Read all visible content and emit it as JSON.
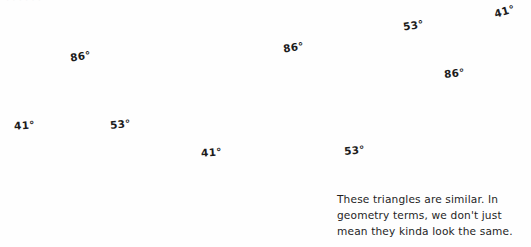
{
  "page": {
    "background_color": "#fefefe",
    "ink_color": "#2b2b2b",
    "arrow_color": "#6d6d6d",
    "width": 531,
    "height": 247
  },
  "figure": {
    "triangles": [
      {
        "id": "triangle-small-left",
        "orientation": "upright",
        "vertices": [
          [
            83,
            44
          ],
          [
            5,
            143
          ],
          [
            146,
            143
          ]
        ],
        "labels": [
          {
            "name": "apex-angle",
            "text": "86°",
            "x": 70,
            "y": 56,
            "rotate": -8
          },
          {
            "name": "bottom-left-angle",
            "text": "41°",
            "x": 15,
            "y": 125,
            "rotate": -4
          },
          {
            "name": "bottom-right-angle",
            "text": "53°",
            "x": 111,
            "y": 125,
            "rotate": -6
          }
        ]
      },
      {
        "id": "triangle-large-middle",
        "orientation": "upright",
        "vertices": [
          [
            298,
            25
          ],
          [
            176,
            177
          ],
          [
            390,
            177
          ]
        ],
        "labels": [
          {
            "name": "apex-angle",
            "text": "86°",
            "x": 284,
            "y": 47,
            "rotate": -8
          },
          {
            "name": "bottom-left-angle",
            "text": "41°",
            "x": 202,
            "y": 152,
            "rotate": -4
          },
          {
            "name": "bottom-right-angle",
            "text": "53°",
            "x": 345,
            "y": 149,
            "rotate": -5
          }
        ]
      },
      {
        "id": "triangle-rotated-right",
        "orientation": "inverted-rotated",
        "vertices": [
          [
            387,
            17
          ],
          [
            527,
            2
          ],
          [
            456,
            108
          ]
        ],
        "labels": [
          {
            "name": "left-angle",
            "text": "53°",
            "x": 404,
            "y": 22,
            "rotate": -9
          },
          {
            "name": "right-angle",
            "text": "41°",
            "x": 495,
            "y": 8,
            "rotate": -16
          },
          {
            "name": "bottom-angle",
            "text": "86°",
            "x": 445,
            "y": 72,
            "rotate": -6
          }
        ]
      }
    ],
    "arrows": [
      {
        "id": "arrow-to-small-triangle",
        "from": [
          348,
          227
        ],
        "to": [
          80,
          152
        ],
        "description": "long curved arrow from caption to left triangle"
      },
      {
        "id": "arrow-to-large-triangle",
        "from": [
          424,
          191
        ],
        "to": [
          385,
          143
        ],
        "description": "curved arrow from caption to middle triangle"
      },
      {
        "id": "arrow-to-rotated-triangle",
        "from": [
          483,
          189
        ],
        "to": [
          487,
          100
        ],
        "description": "curved arrow from caption to right triangle"
      },
      {
        "id": "arrow-top-pointer",
        "from": [
          430,
          0
        ],
        "to": [
          431,
          9
        ],
        "description": "small down arrow above right triangle"
      }
    ]
  },
  "caption": {
    "name": "annotation-caption",
    "lines": [
      "These triangles are similar. In",
      "geometry terms, we don't just",
      "mean they kinda look the same."
    ],
    "full_text": "These triangles are similar. In geometry terms, we don't just mean they kinda look the same."
  },
  "ghost_text": {
    "top_cropped_line": "· · · · · ·"
  }
}
